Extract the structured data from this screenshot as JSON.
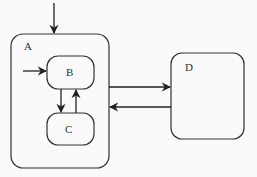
{
  "diagram": {
    "type": "statechart",
    "states": [
      {
        "id": "A",
        "label": "A"
      },
      {
        "id": "B",
        "label": "B",
        "parent": "A"
      },
      {
        "id": "C",
        "label": "C",
        "parent": "A"
      },
      {
        "id": "D",
        "label": "D"
      }
    ],
    "transitions": [
      {
        "from": "initial",
        "to": "A"
      },
      {
        "from": "initial",
        "to": "B"
      },
      {
        "from": "B",
        "to": "C"
      },
      {
        "from": "C",
        "to": "B"
      },
      {
        "from": "A",
        "to": "D"
      },
      {
        "from": "D",
        "to": "A"
      }
    ]
  }
}
